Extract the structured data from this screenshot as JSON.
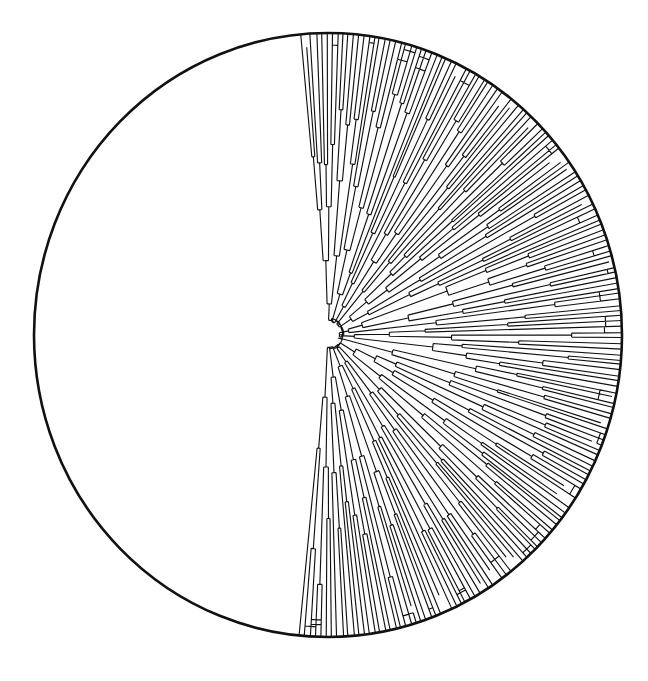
{
  "figure": {
    "kind": "circular-dendrogram",
    "background_color": "#ffffff",
    "stroke_color": "#111111"
  },
  "canvas": {
    "width": 648,
    "height": 681
  },
  "chart_data": {
    "type": "dendrogram",
    "layout": "polar",
    "subtitle": "",
    "xlabel": "",
    "ylabel": "",
    "legend": [],
    "annotations": [],
    "grid": false,
    "center": {
      "x": 328,
      "y": 335
    },
    "radius_x": 294,
    "radius_y": 302,
    "rim_stroke_width": 2.6,
    "branch_stroke_width": 1.15,
    "leaf_count": 184,
    "angle_start_deg": -96,
    "angle_end_deg": 96,
    "empty_sector_deg": 168,
    "root_radius_fraction": 0.035,
    "seed": 20240517,
    "depth_levels": 9,
    "tip_arc_inset_fraction": 0.045
  }
}
